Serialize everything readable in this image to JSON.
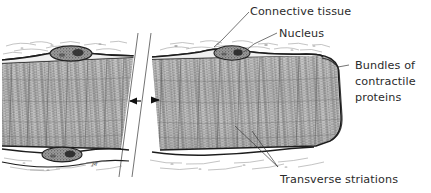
{
  "figure": {
    "kind": "anatomical-illustration",
    "background_color": "#ffffff",
    "ink_color": "#2b2b2b",
    "labels": {
      "connective_tissue": "Connective tissue",
      "nucleus": "Nucleus",
      "bundles_line1": "Bundles of",
      "bundles_line2": "contractile",
      "bundles_line3": "proteins",
      "transverse_striations": "Transverse striations"
    },
    "structures": {
      "fiber_left_segment": "muscle-fiber-left-segment",
      "fiber_right_segment": "muscle-fiber-right-segment",
      "break_band": "diagonal-break-band",
      "length_arrow": "double-headed-arrow",
      "nucleus_top_left": "nucleus",
      "nucleus_top_right": "nucleus",
      "nucleus_bottom_left": "nucleus",
      "connective_tissue_wisps": "connective-tissue-wisps",
      "striation_texture": "transverse-striation-texture",
      "sarcolemma": "sarcolemma-outline"
    },
    "artist_signature": "M"
  }
}
